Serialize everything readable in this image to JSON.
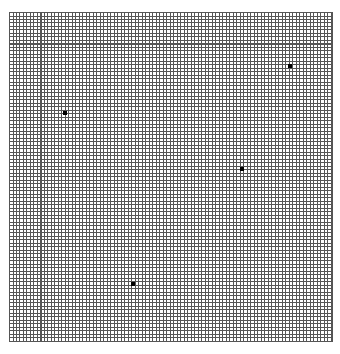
{
  "board": {
    "grid_color": "#555555",
    "background": "#ffffff",
    "cell_size_px": 3.5,
    "origin": [
      9,
      12
    ],
    "size": [
      323,
      329
    ]
  },
  "dots": [
    {
      "x": 65,
      "y": 113
    },
    {
      "x": 290,
      "y": 66
    },
    {
      "x": 242,
      "y": 169
    },
    {
      "x": 133,
      "y": 284
    }
  ]
}
